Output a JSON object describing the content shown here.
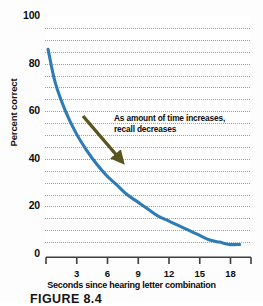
{
  "figure": {
    "caption": "FIGURE 8.4"
  },
  "chart_data": {
    "type": "line",
    "title": "",
    "subtitle": "",
    "xlabel": "Seconds since hearing letter combination",
    "ylabel": "Percent correct",
    "xlim": [
      0,
      20
    ],
    "ylim": [
      0,
      100
    ],
    "grid": true,
    "grid_axis": "y",
    "grid_style": "dotted",
    "grid_interval": 5,
    "legend": false,
    "legend_position": "none",
    "x_tick_labels": [
      "3",
      "6",
      "9",
      "12",
      "15",
      "18"
    ],
    "x_ticks": [
      3,
      6,
      9,
      12,
      15,
      18
    ],
    "y_tick_labels": [
      "0",
      "20",
      "40",
      "60",
      "80",
      "100"
    ],
    "y_ticks": [
      0,
      20,
      40,
      60,
      80,
      100
    ],
    "series": [
      {
        "name": "Recall accuracy",
        "color": "#2e7cb6",
        "x": [
          0.3,
          1,
          2,
          3,
          4,
          5,
          6,
          7,
          8,
          9,
          10,
          11,
          12,
          13,
          14,
          15,
          16,
          17,
          18,
          19
        ],
        "values": [
          86,
          72,
          60,
          51,
          44,
          38,
          33,
          29,
          25,
          22,
          19,
          16,
          14,
          12,
          10,
          8,
          6,
          5,
          4,
          4
        ]
      }
    ],
    "annotations": [
      {
        "text": "As amount of time increases, recall decreases",
        "line1": "As amount of time increases,",
        "line2": "recall decreases",
        "arrow_color": "#5a5520",
        "arrow_from_x": 4.8,
        "arrow_from_y": 55,
        "arrow_to_x": 7.4,
        "arrow_to_y": 36
      }
    ]
  },
  "colors": {
    "curve": "#2e7cb6",
    "arrow": "#5a5520",
    "gridline": "#9aa0a6",
    "axis": "#3f3f3f",
    "text": "#0d0d0d",
    "plot_background": "#ffffff"
  }
}
